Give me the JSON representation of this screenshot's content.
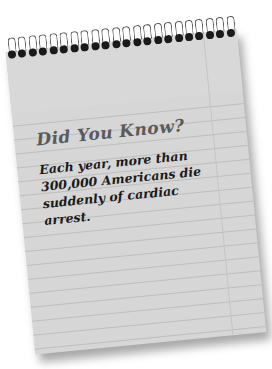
{
  "notepad": {
    "title": "Did You Know?",
    "lines": [
      "Each year, more than",
      "300,000 Americans die",
      "suddenly of cardiac arrest."
    ],
    "coil_count": 22,
    "paper_color": "#d6d6d6",
    "title_color": "#5a5a5a",
    "text_color": "#1a1a1a"
  }
}
